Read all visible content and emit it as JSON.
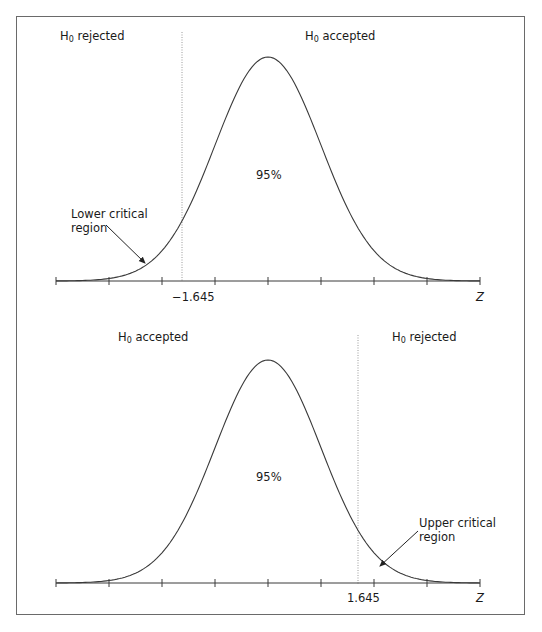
{
  "panels": [
    {
      "id": "lower-tail",
      "left_label": {
        "h": "H",
        "sub": "0",
        "text": " rejected"
      },
      "right_label": {
        "h": "H",
        "sub": "0",
        "text": " accepted"
      },
      "center_percent": "95%",
      "critical_label_line1": "Lower critical",
      "critical_label_line2": "region",
      "critical_value": "−1.645",
      "axis_label": "Z"
    },
    {
      "id": "upper-tail",
      "left_label": {
        "h": "H",
        "sub": "0",
        "text": " accepted"
      },
      "right_label": {
        "h": "H",
        "sub": "0",
        "text": " rejected"
      },
      "center_percent": "95%",
      "critical_label_line1": "Upper critical",
      "critical_label_line2": "region",
      "critical_value": "1.645",
      "axis_label": "Z"
    }
  ],
  "colors": {
    "curve": "#3a3a3a",
    "axis": "#3a3a3a",
    "dotted": "#9a9a9a",
    "frame": "#6a6a6a"
  }
}
